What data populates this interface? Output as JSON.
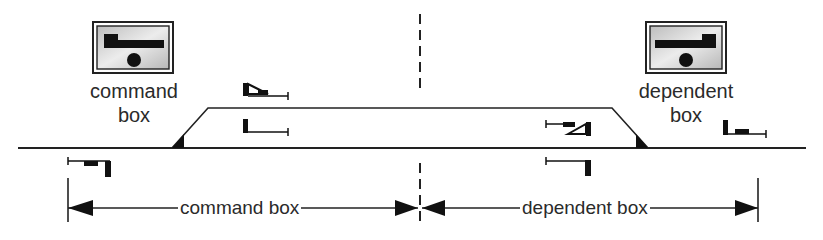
{
  "diagram": {
    "command_box": {
      "label_line1": "command",
      "label_line2": "box",
      "icon": "signal-box-panel-icon"
    },
    "dependent_box": {
      "label_line1": "dependent",
      "label_line2": "box",
      "icon": "signal-box-panel-icon"
    },
    "dimension_labels": {
      "command_area": "command box",
      "dependent_area": "dependent box"
    },
    "colors": {
      "line": "#222222",
      "text": "#2a2a2a",
      "box_fill": "#d0d0d0",
      "background": "#ffffff"
    }
  }
}
